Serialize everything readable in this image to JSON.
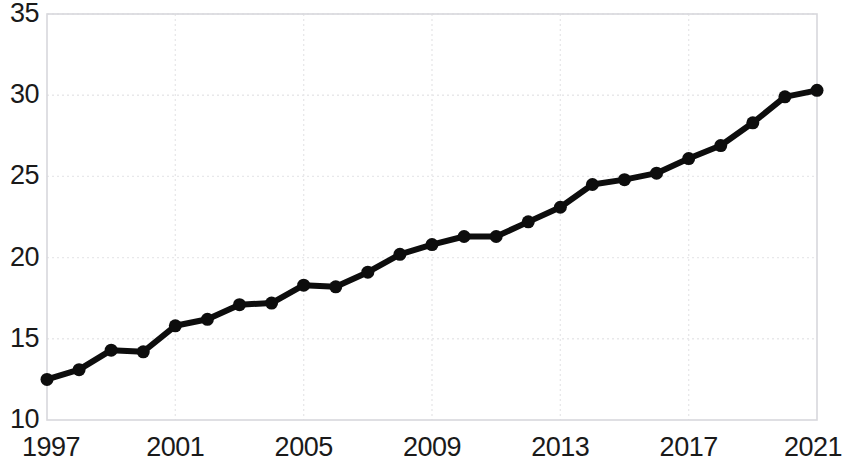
{
  "chart_data": {
    "type": "line",
    "title": "",
    "subtitle": "",
    "xlabel": "",
    "ylabel": "",
    "x": [
      1997,
      1998,
      1999,
      2000,
      2001,
      2002,
      2003,
      2004,
      2005,
      2006,
      2007,
      2008,
      2009,
      2010,
      2011,
      2012,
      2013,
      2014,
      2015,
      2016,
      2017,
      2018,
      2019,
      2020,
      2021
    ],
    "values": [
      12.5,
      13.1,
      14.3,
      14.2,
      15.8,
      16.2,
      17.1,
      17.2,
      18.3,
      18.2,
      19.1,
      20.2,
      20.8,
      21.3,
      21.3,
      22.2,
      23.1,
      24.5,
      24.8,
      25.2,
      26.1,
      26.9,
      28.3,
      29.9,
      30.3
    ],
    "series": [
      {
        "name": "",
        "values": [
          12.5,
          13.1,
          14.3,
          14.2,
          15.8,
          16.2,
          17.1,
          17.2,
          18.3,
          18.2,
          19.1,
          20.2,
          20.8,
          21.3,
          21.3,
          22.2,
          23.1,
          24.5,
          24.8,
          25.2,
          26.1,
          26.9,
          28.3,
          29.9,
          30.3
        ],
        "color": "#0d0d0d"
      }
    ],
    "xlim": [
      1997,
      2021
    ],
    "ylim": [
      10,
      35
    ],
    "xticks": [
      1997,
      2001,
      2005,
      2009,
      2013,
      2017,
      2021
    ],
    "xtick_labels": [
      "1997",
      "2001",
      "2005",
      "2009",
      "2013",
      "2017",
      "2021"
    ],
    "yticks": [
      10,
      15,
      20,
      25,
      30,
      35
    ],
    "ytick_labels": [
      "10",
      "15",
      "20",
      "25",
      "30",
      "35"
    ],
    "grid": true,
    "grid_style": "dotted",
    "grid_color": "#e8e8ea",
    "legend": false,
    "legend_position": "none",
    "marker": "circle",
    "marker_size": 13,
    "line_width": 6,
    "plot_bg": "#ffffff",
    "border_color": "#d8d8dc"
  },
  "layout": {
    "plot_left": 47,
    "plot_right": 817,
    "plot_top": 14,
    "plot_bottom": 420
  }
}
